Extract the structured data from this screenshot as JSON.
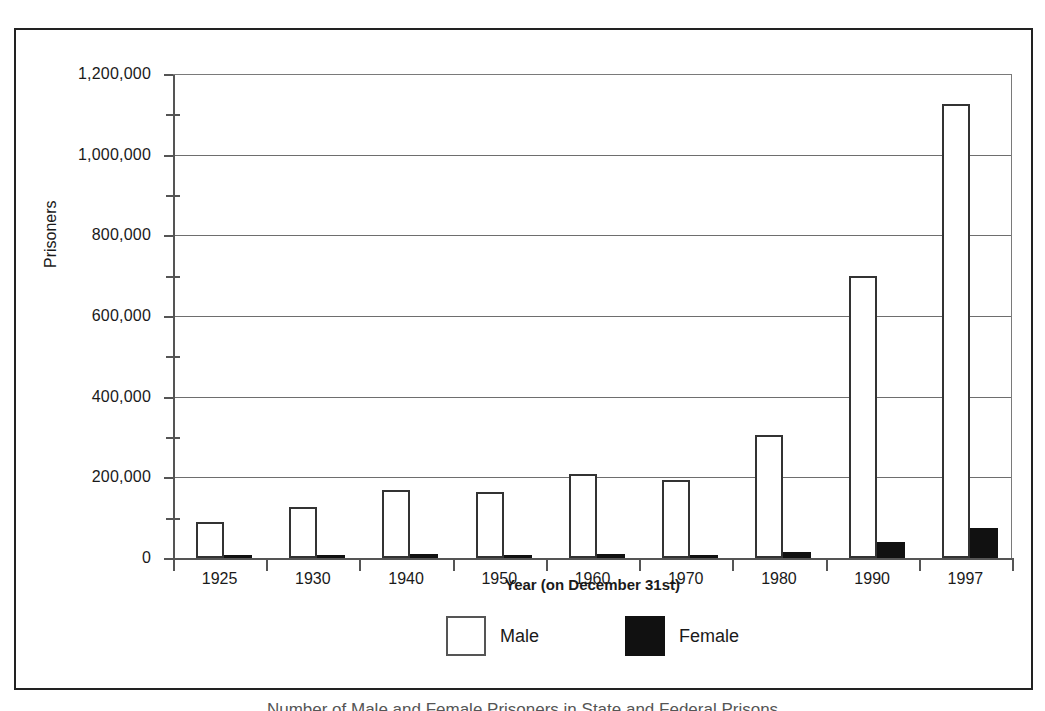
{
  "figure": {
    "caption": "Number of Male and Female Prisoners in State and Federal Prisons"
  },
  "chart_data": {
    "type": "bar",
    "title": "",
    "subtitle": "",
    "xlabel": "Year  (on December 31st)",
    "ylabel": "Prisoners",
    "categories": [
      "1925",
      "1930",
      "1940",
      "1950",
      "1960",
      "1970",
      "1980",
      "1990",
      "1997"
    ],
    "series": [
      {
        "name": "Male",
        "color": "#ffffff",
        "values": [
          89000,
          126000,
          169000,
          163000,
          208000,
          193000,
          305000,
          700000,
          1125000
        ]
      },
      {
        "name": "Female",
        "color": "#111111",
        "values": [
          6000,
          7000,
          10000,
          7000,
          11000,
          7000,
          14000,
          40000,
          75000
        ]
      }
    ],
    "ylim": [
      0,
      1200000
    ],
    "ytick_labels": [
      "0",
      "200,000",
      "400,000",
      "600,000",
      "800,000",
      "1,000,000",
      "1,200,000"
    ],
    "ytick_values": [
      0,
      200000,
      400000,
      600000,
      800000,
      1000000,
      1200000
    ],
    "yminor_values": [
      100000,
      300000,
      500000,
      700000,
      900000,
      1100000
    ],
    "grid": "horizontal-major",
    "legend_position": "bottom-center",
    "legend": [
      {
        "label": "Male",
        "swatch": "white-outline"
      },
      {
        "label": "Female",
        "swatch": "solid-black"
      }
    ]
  }
}
